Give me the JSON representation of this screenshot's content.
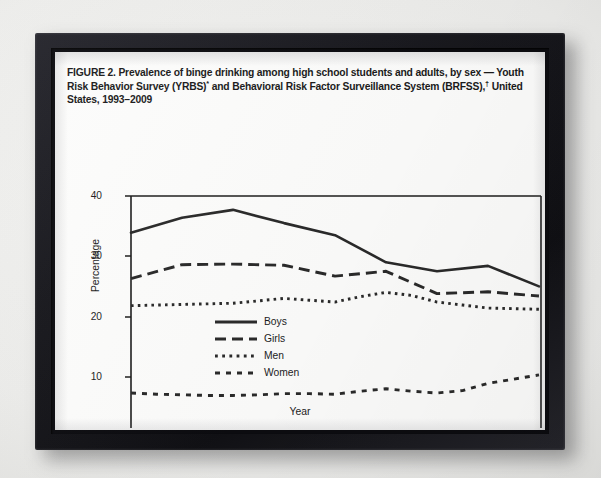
{
  "figure": {
    "title_line1": "FIGURE 2. Prevalence of binge drinking among high school students and adults, by",
    "title_line2_a": "sex — Youth Risk Behavior Survey (YRBS)",
    "title_line2_sup": "*",
    "title_line2_b": " and Behavioral Risk Factor Surveillance",
    "title_line3_a": "System (BRFSS),",
    "title_line3_sup": "†",
    "title_line3_b": " United States, 1993–2009"
  },
  "chart_data": {
    "type": "line",
    "xlabel": "Year",
    "ylabel": "Percentage",
    "x": [
      1993,
      1994,
      1995,
      1996,
      1997,
      1998,
      1999,
      2000,
      2001,
      2002,
      2003,
      2004,
      2005,
      2006,
      2007,
      2008,
      2009
    ],
    "xticks": [
      1993,
      1995,
      1997,
      1999,
      2001,
      2003,
      2005,
      2007,
      2009
    ],
    "yticks": [
      0,
      10,
      20,
      30,
      40
    ],
    "xlim": [
      1993,
      2009
    ],
    "ylim": [
      0,
      40
    ],
    "grid": false,
    "legend_position": "center-right inside axes",
    "series": [
      {
        "name": "Boys",
        "style": "solid",
        "source": "YRBS",
        "x": [
          1993,
          1995,
          1997,
          1999,
          2001,
          2003,
          2005,
          2007,
          2009
        ],
        "values": [
          33.9,
          36.4,
          37.7,
          35.5,
          33.5,
          29.0,
          27.5,
          28.4,
          25.0
        ]
      },
      {
        "name": "Girls",
        "style": "dashed",
        "source": "YRBS",
        "x": [
          1993,
          1995,
          1997,
          1999,
          2001,
          2003,
          2005,
          2007,
          2009
        ],
        "values": [
          26.3,
          28.6,
          28.7,
          28.5,
          26.7,
          27.5,
          23.8,
          24.1,
          23.4
        ]
      },
      {
        "name": "Men",
        "style": "dotted",
        "source": "BRFSS",
        "x": [
          1993,
          1994,
          1995,
          1996,
          1997,
          1998,
          1999,
          2000,
          2001,
          2002,
          2003,
          2004,
          2005,
          2006,
          2007,
          2008,
          2009
        ],
        "values": [
          21.8,
          21.9,
          22.0,
          22.1,
          22.2,
          22.6,
          23.0,
          22.7,
          22.4,
          23.3,
          24.0,
          23.5,
          22.4,
          21.9,
          21.4,
          21.3,
          21.2
        ]
      },
      {
        "name": "Women",
        "style": "dashed-wide",
        "source": "BRFSS",
        "x": [
          1993,
          1994,
          1995,
          1996,
          1997,
          1998,
          1999,
          2000,
          2001,
          2002,
          2003,
          2004,
          2005,
          2006,
          2007,
          2008,
          2009
        ],
        "values": [
          7.3,
          7.1,
          7.0,
          6.9,
          6.9,
          7.0,
          7.2,
          7.2,
          7.1,
          7.6,
          8.0,
          7.6,
          7.3,
          7.7,
          8.9,
          9.6,
          10.3
        ]
      }
    ],
    "legend_entries": [
      "Boys",
      "Girls",
      "Men",
      "Women"
    ]
  },
  "axes": {
    "y_tick_labels": [
      "40",
      "30",
      "20",
      "10",
      "0"
    ],
    "x_tick_labels": [
      "1993",
      "1995",
      "1997",
      "1999",
      "2001",
      "2003",
      "2005",
      "2007",
      "2009"
    ],
    "y_axis_title": "Percentage",
    "x_axis_title": "Year"
  },
  "legend": {
    "items": [
      {
        "label": "Boys"
      },
      {
        "label": "Girls"
      },
      {
        "label": "Men"
      },
      {
        "label": "Women"
      }
    ]
  },
  "colors": {
    "ink": "#1c1c1c",
    "page": "#fdfdfc",
    "frame": "#17171c",
    "backdrop": "#e9e9e7"
  }
}
